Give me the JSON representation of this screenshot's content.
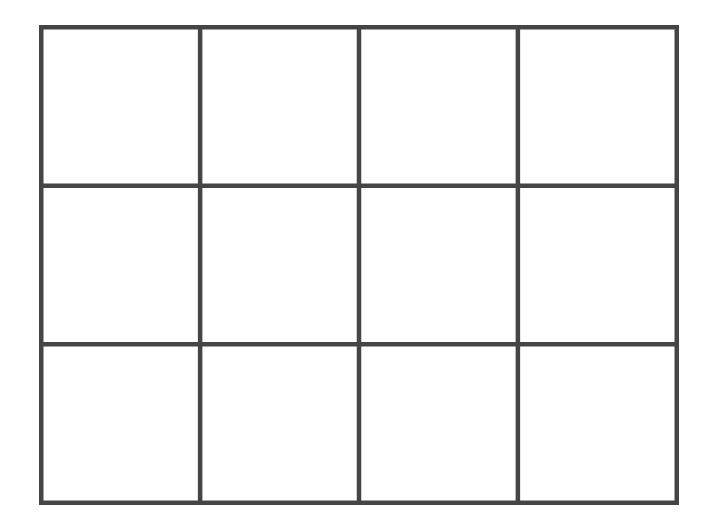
{
  "diagram": {
    "type": "grid",
    "rows": 3,
    "columns": 4,
    "cells": 12,
    "line_color": "#454545",
    "background_color": "#ffffff",
    "cells_content": [
      [
        "",
        "",
        "",
        ""
      ],
      [
        "",
        "",
        "",
        ""
      ],
      [
        "",
        "",
        "",
        ""
      ]
    ]
  }
}
